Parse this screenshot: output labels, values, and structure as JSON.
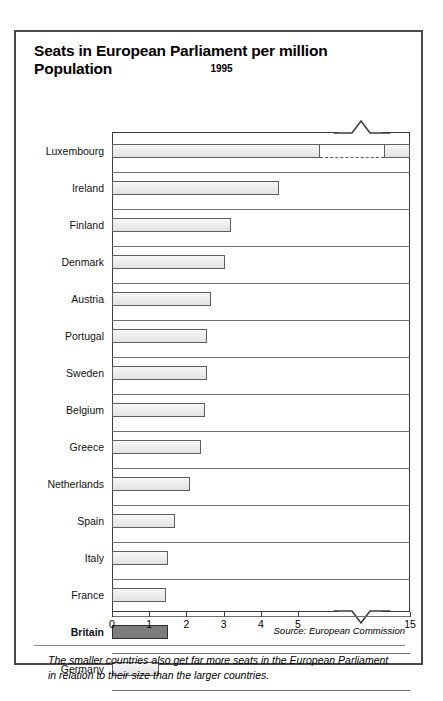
{
  "panel": {
    "title": "Seats in European Parliament per million Population",
    "subtitle": "1995",
    "source": "Source: European Commission",
    "caption": "The smaller countries also get far more seats in the European Parliament in relation to their size than the larger countries."
  },
  "chart_data": {
    "type": "bar",
    "orientation": "horizontal",
    "title": "Seats in European Parliament per million Population",
    "subtitle": "1995",
    "xlabel": "",
    "ylabel": "",
    "xlim": [
      0,
      15
    ],
    "axis_break": {
      "from": 5.6,
      "to": 14.2,
      "style": "zigzag"
    },
    "grid": false,
    "legend": false,
    "highlight_category": "Britain",
    "highlight_color": "#7d7d7d",
    "bar_color": "#ececec",
    "bar_edge_color": "#5d5d5d",
    "tick_labels": [
      "0",
      "1",
      "2",
      "3",
      "4",
      "5",
      "15"
    ],
    "tick_values": [
      0,
      1,
      2,
      3,
      4,
      5,
      15
    ],
    "categories": [
      "Luxembourg",
      "Ireland",
      "Finland",
      "Denmark",
      "Austria",
      "Portugal",
      "Sweden",
      "Belgium",
      "Greece",
      "Netherlands",
      "Spain",
      "Italy",
      "France",
      "Britain",
      "Germany"
    ],
    "values": [
      15.0,
      4.5,
      3.2,
      3.05,
      2.65,
      2.55,
      2.55,
      2.5,
      2.4,
      2.1,
      1.7,
      1.5,
      1.45,
      1.5,
      1.25
    ]
  }
}
